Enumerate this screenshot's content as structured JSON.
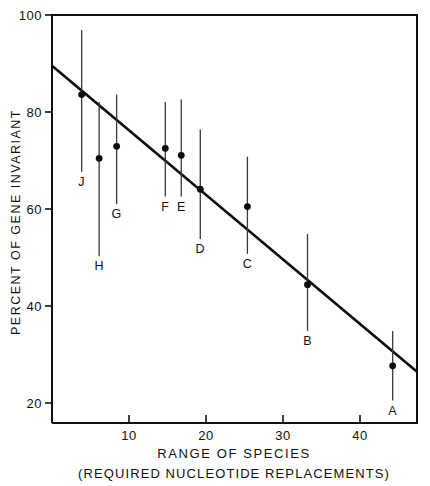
{
  "chart_data": {
    "type": "scatter",
    "title": "",
    "subtitle": "",
    "xlabel": "RANGE OF SPECIES",
    "xlabel_sub": "(REQUIRED NUCLEOTIDE REPLACEMENTS)",
    "ylabel": "PERCENT OF GENE INVARIANT",
    "xlim": [
      0,
      48
    ],
    "ylim": [
      18,
      100
    ],
    "xticks": [
      10,
      20,
      30,
      40
    ],
    "xtick_labels": [
      "10",
      "20",
      "30",
      "40"
    ],
    "yticks": [
      20,
      40,
      60,
      80,
      100
    ],
    "ytick_labels": [
      "20",
      "40",
      "60",
      "80",
      "100"
    ],
    "grid": false,
    "legend": "none",
    "error_bar_orientation": "vertical",
    "points": [
      {
        "label": "J",
        "x": 3.9,
        "y": 84.0,
        "y_low": 68.5,
        "y_high": 97.0,
        "label_pos": "below"
      },
      {
        "label": "H",
        "x": 6.2,
        "y": 71.2,
        "y_low": 51.5,
        "y_high": 82.5,
        "label_pos": "below"
      },
      {
        "label": "G",
        "x": 8.5,
        "y": 73.6,
        "y_low": 62.0,
        "y_high": 84.0,
        "label_pos": "below"
      },
      {
        "label": "F",
        "x": 14.9,
        "y": 73.2,
        "y_low": 63.5,
        "y_high": 82.5,
        "label_pos": "below"
      },
      {
        "label": "E",
        "x": 17.0,
        "y": 71.8,
        "y_low": 63.5,
        "y_high": 83.0,
        "label_pos": "below"
      },
      {
        "label": "D",
        "x": 19.5,
        "y": 65.0,
        "y_low": 55.0,
        "y_high": 77.0,
        "label_pos": "below"
      },
      {
        "label": "C",
        "x": 25.7,
        "y": 61.5,
        "y_low": 52.0,
        "y_high": 71.5,
        "label_pos": "below"
      },
      {
        "label": "B",
        "x": 33.6,
        "y": 45.8,
        "y_low": 36.5,
        "y_high": 56.0,
        "label_pos": "below"
      },
      {
        "label": "A",
        "x": 44.8,
        "y": 29.5,
        "y_low": 22.5,
        "y_high": 36.5,
        "label_pos": "below"
      }
    ],
    "fit_line": {
      "name": "regression-line",
      "x_start": 0.0,
      "y_start": 89.8,
      "x_end": 48.0,
      "y_end": 28.3
    },
    "colors": {
      "axis": "#101010",
      "point": "#0a0a0a",
      "error_bar": "#3a3a3a",
      "fit_line": "#0c0c0c",
      "background": "#ffffff"
    }
  }
}
